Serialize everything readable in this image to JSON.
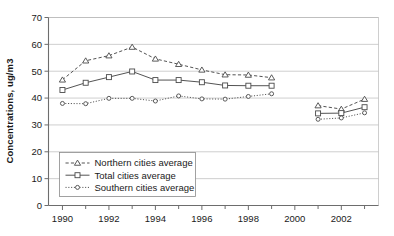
{
  "chart_data": {
    "type": "line",
    "title": "",
    "subtitle": "",
    "xlabel": "",
    "ylabel": "Concentrations, ug/m3",
    "xlim": [
      1989.4,
      2003.6
    ],
    "ylim": [
      0,
      70
    ],
    "grid": true,
    "legend_position": "inside-lower-left",
    "x_ticks": [
      1990,
      1992,
      1994,
      1996,
      1998,
      2000,
      2002
    ],
    "x_tick_labels": [
      "1990",
      "1992",
      "1994",
      "1996",
      "1998",
      "2000",
      "2002"
    ],
    "x_minor_ticks": [
      1991,
      1993,
      1995,
      1997,
      1999,
      2001,
      2003
    ],
    "y_ticks": [
      0,
      10,
      20,
      30,
      40,
      50,
      60,
      70
    ],
    "y_tick_labels": [
      "0",
      "10",
      "20",
      "30",
      "40",
      "50",
      "60",
      "70"
    ],
    "series": [
      {
        "name": "Northern cities average",
        "marker": "triangle",
        "linestyle": "dashed",
        "color": "#4a4a4a",
        "x": [
          1990,
          1991,
          1992,
          1993,
          1994,
          1995,
          1996,
          1997,
          1998,
          1999,
          2001,
          2002,
          2003
        ],
        "values": [
          46.8,
          53.9,
          55.8,
          59.0,
          54.6,
          52.6,
          50.5,
          48.7,
          48.6,
          47.6,
          37.2,
          35.9,
          39.6
        ]
      },
      {
        "name": "Total cities average",
        "marker": "square",
        "linestyle": "solid",
        "color": "#4a4a4a",
        "x": [
          1990,
          1991,
          1992,
          1993,
          1994,
          1995,
          1996,
          1997,
          1998,
          1999,
          2001,
          2002,
          2003
        ],
        "values": [
          43.0,
          45.7,
          47.8,
          49.9,
          46.7,
          46.7,
          45.9,
          44.7,
          44.6,
          44.6,
          34.3,
          34.4,
          36.6
        ]
      },
      {
        "name": "Southern cities average",
        "marker": "circle",
        "linestyle": "dotted",
        "color": "#4a4a4a",
        "x": [
          1990,
          1991,
          1992,
          1993,
          1994,
          1995,
          1996,
          1997,
          1998,
          1999,
          2001,
          2002,
          2003
        ],
        "values": [
          38.0,
          37.9,
          39.9,
          39.9,
          38.9,
          40.8,
          39.7,
          39.6,
          40.6,
          41.6,
          32.1,
          32.6,
          34.5
        ]
      }
    ]
  },
  "legend": {
    "items": [
      {
        "label": "Northern cities average"
      },
      {
        "label": "Total cities average"
      },
      {
        "label": "Southern cities average"
      }
    ]
  }
}
